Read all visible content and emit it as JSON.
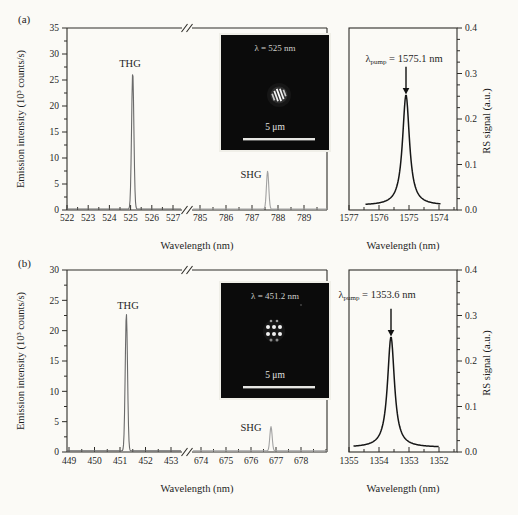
{
  "colors": {
    "axis": "#2e2c28",
    "spectrum_seg1": "#6a6a6a",
    "spectrum_seg2": "#a2a2a2",
    "rs_curve": "#161616",
    "arrow": "#111111",
    "inset_bg": "#0b0b0b",
    "inset_text": "#cfcfca"
  },
  "panels": [
    {
      "label": "(a)",
      "emission_ylabel": "Emission intensity (10³ counts/s)",
      "xlabel": "Wavelength (nm)",
      "peaks": {
        "thg": "THG",
        "shg": "SHG"
      },
      "inset": {
        "lambda": "λ = 525 nm",
        "scale": "5 μm"
      },
      "pump": {
        "symbol": "λ",
        "sub": "pump",
        "rest": " = 1575.1 nm"
      },
      "rs_ylabel": "RS signal (a.u.)",
      "rs_xlabel": "Wavelength (nm)"
    },
    {
      "label": "(b)",
      "emission_ylabel": "Emission intensity (10³ counts/s)",
      "xlabel": "Wavelength (nm)",
      "peaks": {
        "thg": "THG",
        "shg": "SHG"
      },
      "inset": {
        "lambda": "λ = 451.2 nm",
        "scale": "5 μm"
      },
      "pump": {
        "symbol": "λ",
        "sub": "pump",
        "rest": " = 1353.6 nm"
      },
      "rs_ylabel": "RS signal (a.u.)",
      "rs_xlabel": "Wavelength (nm)"
    }
  ],
  "chart_data": [
    {
      "type": "line",
      "panel": "a",
      "role": "emission-spectrum",
      "xlabel": "Wavelength (nm)",
      "ylabel": "Emission intensity (10³ counts/s)",
      "ylim": [
        0,
        35
      ],
      "ytick_step": 5,
      "ytick_minor_step": 2.5,
      "x_break": true,
      "baseline": 0.18,
      "segments": [
        {
          "xticks": [
            522,
            523,
            524,
            525,
            526,
            527
          ],
          "xminor_step": 0.5
        },
        {
          "xticks": [
            785,
            786,
            787,
            788,
            789
          ],
          "xminor_step": 0.5
        }
      ],
      "peaks": [
        {
          "label": "THG",
          "segment": 0,
          "center_nm": 525.1,
          "height": 26.3
        },
        {
          "label": "SHG",
          "segment": 1,
          "center_nm": 787.6,
          "height": 7.3
        }
      ]
    },
    {
      "type": "line",
      "panel": "a",
      "role": "raman-signal",
      "xlabel": "Wavelength (nm)",
      "ylabel": "RS signal (a.u.)",
      "ylim": [
        0,
        0.4
      ],
      "yticks": [
        0,
        0.1,
        0.2,
        0.3,
        0.4
      ],
      "ytick_minor_step": 0.025,
      "x_reversed": true,
      "xticks": [
        1577,
        1576,
        1575,
        1574
      ],
      "xminor_step": 0.5,
      "peak": {
        "center_nm": 1575.1,
        "amplitude": 0.243,
        "fwhm_nm": 0.28,
        "baseline": 0.01
      },
      "draw_range_nm": [
        1576.45,
        1573.95
      ],
      "annotation": "λ_pump = 1575.1 nm"
    },
    {
      "type": "line",
      "panel": "b",
      "role": "emission-spectrum",
      "xlabel": "Wavelength (nm)",
      "ylabel": "Emission intensity (10³ counts/s)",
      "ylim": [
        0,
        30
      ],
      "ytick_step": 5,
      "ytick_minor_step": 2.5,
      "x_break": true,
      "baseline": 0.18,
      "segments": [
        {
          "xticks": [
            449,
            450,
            451,
            452,
            453
          ],
          "xminor_step": 0.5
        },
        {
          "xticks": [
            674,
            675,
            676,
            677,
            678
          ],
          "xminor_step": 0.5
        }
      ],
      "peaks": [
        {
          "label": "THG",
          "segment": 0,
          "center_nm": 451.25,
          "height": 22.6
        },
        {
          "label": "SHG",
          "segment": 1,
          "center_nm": 676.8,
          "height": 4.0
        }
      ]
    },
    {
      "type": "line",
      "panel": "b",
      "role": "raman-signal",
      "xlabel": "Wavelength (nm)",
      "ylabel": "RS signal (a.u.)",
      "ylim": [
        0,
        0.4
      ],
      "yticks": [
        0,
        0.1,
        0.2,
        0.3,
        0.4
      ],
      "ytick_minor_step": 0.025,
      "x_reversed": true,
      "xticks": [
        1355,
        1354,
        1353,
        1352
      ],
      "xminor_step": 0.5,
      "peak": {
        "center_nm": 1353.6,
        "amplitude": 0.243,
        "fwhm_nm": 0.28,
        "baseline": 0.01
      },
      "draw_range_nm": [
        1354.85,
        1352.0
      ],
      "annotation": "λ_pump = 1353.6 nm"
    }
  ]
}
